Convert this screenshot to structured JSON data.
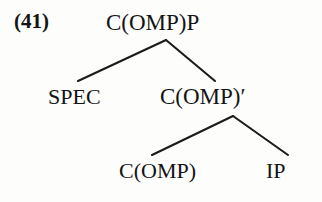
{
  "figure": {
    "example_number": "(41)",
    "type": "syntax-tree",
    "caption": ""
  },
  "colors": {
    "ink": "#141414",
    "line": "#1b1b1b",
    "background": "#fdfdfc"
  },
  "tree": {
    "root": {
      "id": "root",
      "label": "C(OMP)P"
    },
    "level2": [
      {
        "id": "spec",
        "label": "SPEC"
      },
      {
        "id": "cbar",
        "label": "C(OMP)′"
      }
    ],
    "level3": [
      {
        "id": "comp",
        "label": "C(OMP)"
      },
      {
        "id": "ip",
        "label": "IP"
      }
    ],
    "edges": [
      {
        "from": "root",
        "to": "spec",
        "x1": 166,
        "y1": 40,
        "x2": 78,
        "y2": 81
      },
      {
        "from": "root",
        "to": "cbar",
        "x1": 166,
        "y1": 40,
        "x2": 215,
        "y2": 81
      },
      {
        "from": "cbar",
        "to": "comp",
        "x1": 233,
        "y1": 116,
        "x2": 152,
        "y2": 155
      },
      {
        "from": "cbar",
        "to": "ip",
        "x1": 233,
        "y1": 116,
        "x2": 288,
        "y2": 155
      }
    ]
  }
}
